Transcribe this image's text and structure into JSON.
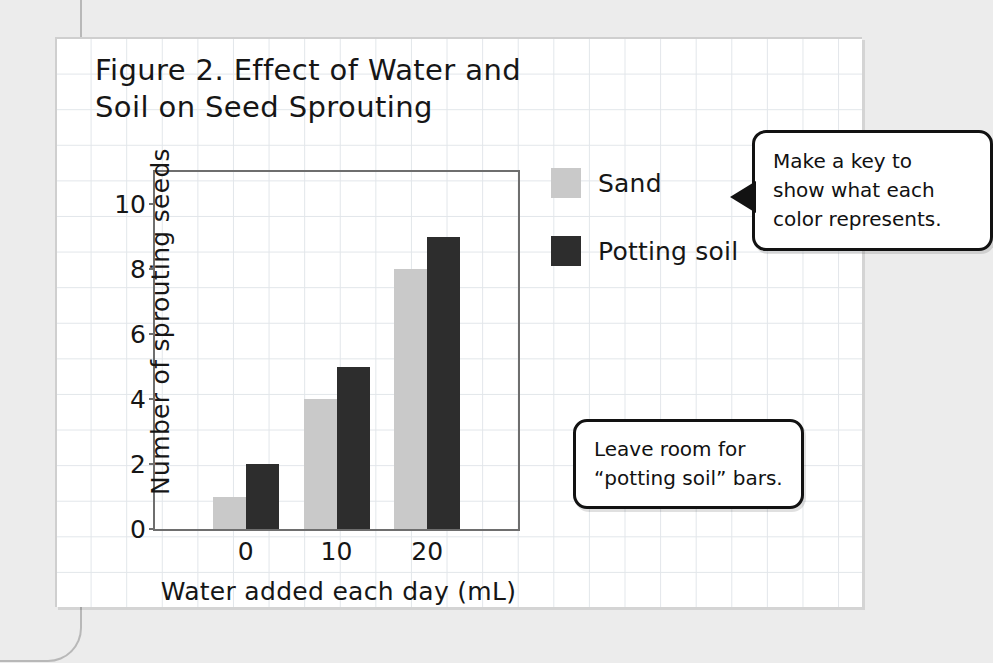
{
  "page": {
    "background_color": "#ececec",
    "paper_color": "#ffffff",
    "grid_line_color": "#e2e6ea"
  },
  "figure": {
    "title": "Figure 2. Effect of Water and\nSoil on Seed Sprouting"
  },
  "legend": {
    "items": [
      {
        "label": "Sand",
        "color": "#c9c9c9",
        "swatch_name": "sand-swatch"
      },
      {
        "label": "Potting soil",
        "color": "#2d2d2d",
        "swatch_name": "potting-soil-swatch"
      }
    ]
  },
  "callouts": [
    {
      "id": "key",
      "text": "Make a key to\nshow what each\ncolor represents.",
      "tail": "left"
    },
    {
      "id": "room",
      "text": "Leave room for\n“potting soil” bars.",
      "tail": "none"
    }
  ],
  "chart_data": {
    "type": "bar",
    "title": "Figure 2. Effect of Water and Soil on Seed Sprouting",
    "xlabel": "Water added each day (mL)",
    "ylabel": "Number of sprouting seeds",
    "categories": [
      "0",
      "10",
      "20"
    ],
    "series": [
      {
        "name": "Sand",
        "color": "#c9c9c9",
        "values": [
          1,
          4,
          8
        ]
      },
      {
        "name": "Potting soil",
        "color": "#2d2d2d",
        "values": [
          2,
          5,
          9
        ]
      }
    ],
    "ylim": [
      0,
      11
    ],
    "yticks": [
      0,
      2,
      4,
      6,
      8,
      10
    ],
    "ytick_labels": [
      "0",
      "2",
      "4",
      "6",
      "8",
      "10"
    ],
    "xtick_labels": [
      "0",
      "10",
      "20"
    ],
    "grid": false,
    "legend_position": "right",
    "frame": true
  }
}
